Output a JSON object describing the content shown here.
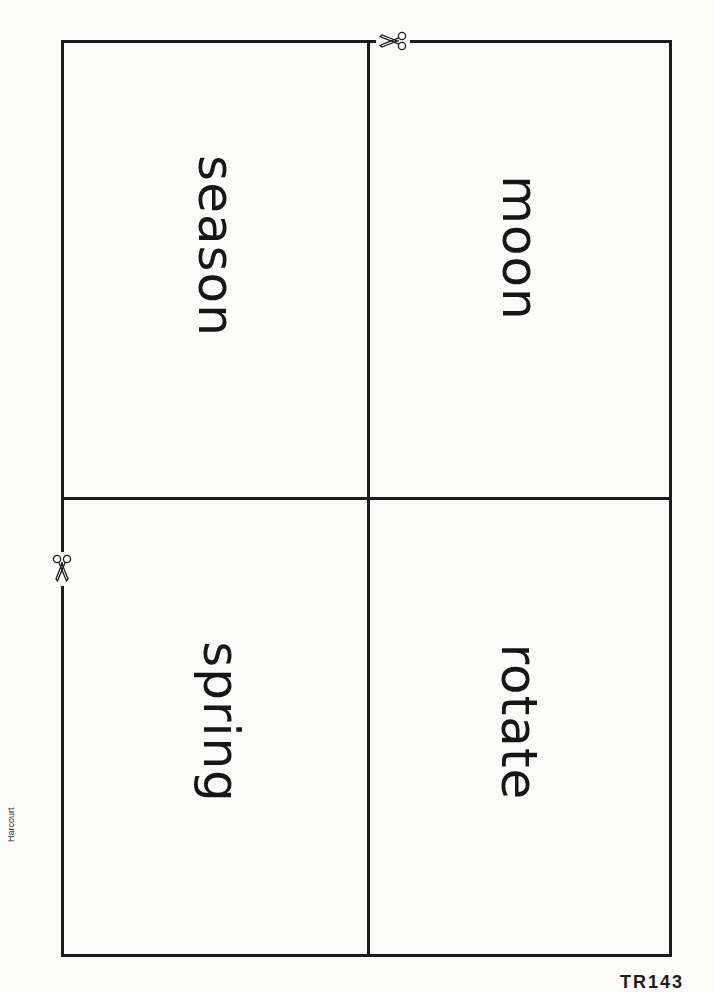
{
  "cards": [
    {
      "word": "season",
      "position": "top-left"
    },
    {
      "word": "moon",
      "position": "top-right"
    },
    {
      "word": "spring",
      "position": "bottom-left"
    },
    {
      "word": "rotate",
      "position": "bottom-right"
    }
  ],
  "icons": {
    "cut_top": "scissors-icon",
    "cut_left": "scissors-icon"
  },
  "footer": {
    "publisher": "Harcourt",
    "page_code": "TR143"
  },
  "colors": {
    "line": "#1c1c1c",
    "text": "#161616",
    "paper": "#fbfbfa"
  }
}
